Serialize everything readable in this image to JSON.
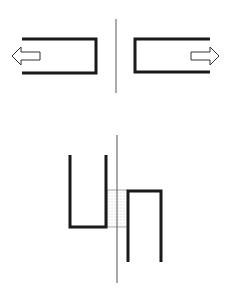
{
  "diagram": {
    "colors": {
      "stroke": "#1a1a1a",
      "axis": "#555555",
      "overlap_fill": "#e6e6e6",
      "background": "#ffffff"
    },
    "top_panel": {
      "axis": {
        "x": 116,
        "y1": 19,
        "y2": 93
      },
      "left_bracket": {
        "x1": 22,
        "x2": 96,
        "y_top": 39,
        "y_bottom": 73,
        "open_side": "left"
      },
      "right_bracket": {
        "x1": 135,
        "x2": 210,
        "y_top": 39,
        "y_bottom": 72,
        "open_side": "right"
      },
      "left_arrow": {
        "direction": "left",
        "tip_x": 12,
        "tail_x": 40,
        "y": 56
      },
      "right_arrow": {
        "direction": "right",
        "tip_x": 219,
        "tail_x": 190,
        "y": 56
      }
    },
    "bottom_panel": {
      "axis": {
        "x": 117,
        "y1": 135,
        "y2": 283
      },
      "u_shape": {
        "x_left": 70,
        "x_right": 106,
        "y_top": 155,
        "y_bottom": 227
      },
      "n_shape": {
        "x_left": 128,
        "x_right": 161,
        "y_top": 191,
        "y_bottom": 262
      },
      "overlap_region": {
        "x1": 107,
        "x2": 128,
        "y1": 190,
        "y2": 227
      }
    }
  }
}
